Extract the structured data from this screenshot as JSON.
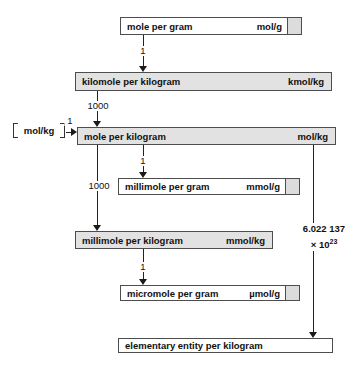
{
  "diagram": {
    "boxes": [
      {
        "id": "mole-per-gram",
        "label": "mole per gram",
        "unit": "mol/g"
      },
      {
        "id": "kilomole-per-kilogram",
        "label": "kilomole per kilogram",
        "unit": "kmol/kg"
      },
      {
        "id": "mole-per-kilogram",
        "label": "mole per kilogram",
        "unit": "mol/kg"
      },
      {
        "id": "millimole-per-gram",
        "label": "millimole per gram",
        "unit": "mmol/g"
      },
      {
        "id": "millimole-per-kilogram",
        "label": "millimole per kilogram",
        "unit": "mmol/kg"
      },
      {
        "id": "micromole-per-gram",
        "label": "micromole per gram",
        "unit": "µmol/g"
      },
      {
        "id": "elementary-entity-per-kilogram",
        "label": "elementary entity per kilogram",
        "unit": ""
      }
    ],
    "side_label": {
      "unit": "mol/kg"
    },
    "arrows": [
      {
        "from": "mole-per-gram",
        "to": "kilomole-per-kilogram",
        "factor": "1"
      },
      {
        "from": "kilomole-per-kilogram",
        "to": "mole-per-kilogram",
        "factor": "1000"
      },
      {
        "from": "side-label",
        "to": "mole-per-kilogram",
        "factor": "1"
      },
      {
        "from": "mole-per-kilogram",
        "to": "millimole-per-gram",
        "factor": "1"
      },
      {
        "from": "mole-per-kilogram",
        "to": "millimole-per-kilogram",
        "factor": "1000"
      },
      {
        "from": "millimole-per-kilogram",
        "to": "micromole-per-gram",
        "factor": "1"
      },
      {
        "from": "mole-per-kilogram",
        "to": "elementary-entity-per-kilogram",
        "factor_line1": "6.022 137",
        "factor_base": "× 10",
        "factor_exp": "23"
      }
    ],
    "colors": {
      "box_gray": "#e2e2e2",
      "box_white": "#ffffff",
      "unit_cell": "#dcdcdc",
      "border": "#4d4d4d",
      "line": "#222222"
    }
  }
}
